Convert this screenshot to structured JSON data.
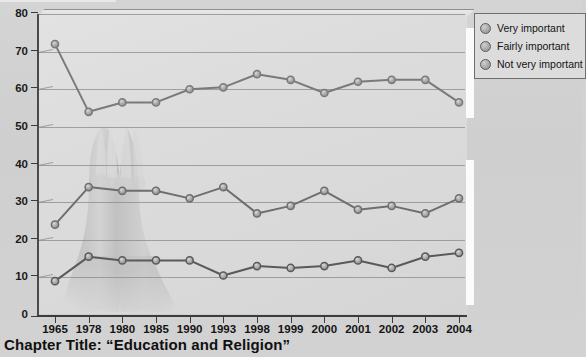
{
  "caption": "Chapter Title: “Education and Religion”",
  "legend": {
    "items": [
      {
        "label": "Very important",
        "color": "#8d8d8d",
        "icon": "circle-marker-icon"
      },
      {
        "label": "Fairly important",
        "color": "#8d8d8d",
        "icon": "circle-marker-icon"
      },
      {
        "label": "Not very important",
        "color": "#8d8d8d",
        "icon": "circle-marker-icon"
      }
    ]
  },
  "watermark": {
    "name": "praying-hands-image",
    "description": "Faded photograph of praying hands behind the plot"
  },
  "chart_data": {
    "type": "line",
    "title": "",
    "xlabel": "",
    "ylabel": "",
    "ylim": [
      0,
      80
    ],
    "ytick_step": 10,
    "yticks": [
      0,
      10,
      20,
      30,
      40,
      50,
      60,
      70,
      80
    ],
    "grid": true,
    "legend_position": "top-right",
    "categories": [
      "1965",
      "1978",
      "1980",
      "1985",
      "1990",
      "1993",
      "1998",
      "1999",
      "2000",
      "2001",
      "2002",
      "2003",
      "2004"
    ],
    "series": [
      {
        "name": "Very important",
        "color": "#7a7a7a",
        "values": [
          72,
          54,
          56.5,
          56.5,
          60,
          60.5,
          64,
          62.5,
          59,
          62,
          62.5,
          62.5,
          56.5
        ]
      },
      {
        "name": "Fairly important",
        "color": "#6e6e6e",
        "values": [
          24,
          34,
          33,
          33,
          31,
          34,
          27,
          29,
          33,
          28,
          29,
          27,
          31
        ]
      },
      {
        "name": "Not very important",
        "color": "#5a5a5a",
        "values": [
          9,
          15.5,
          14.5,
          14.5,
          14.5,
          10.5,
          13,
          12.5,
          13,
          14.5,
          12.5,
          15.5,
          16.5
        ]
      }
    ]
  }
}
